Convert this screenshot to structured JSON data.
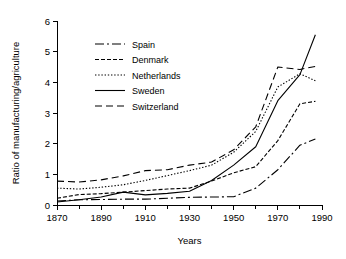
{
  "chart_data": {
    "type": "line",
    "title": "",
    "xlabel": "Years",
    "ylabel": "Ratio of manufacturing/agriculture",
    "xlim": [
      1870,
      1990
    ],
    "ylim": [
      0,
      6
    ],
    "xticks": [
      1870,
      1890,
      1910,
      1930,
      1950,
      1970,
      1990
    ],
    "xtick_labels": [
      "1870",
      "1890",
      "1910",
      "1930",
      "1950",
      "1970",
      "1990"
    ],
    "xminor_ticks": [
      1880,
      1900,
      1920,
      1940,
      1960,
      1980
    ],
    "yticks": [
      0,
      1,
      2,
      3,
      4,
      5,
      6
    ],
    "ytick_labels": [
      "0",
      "1",
      "2",
      "3",
      "4",
      "5",
      "6"
    ],
    "grid": false,
    "legend_position": "upper left",
    "series": [
      {
        "name": "Spain",
        "style": "dashdot",
        "dash": "9,3,2,3",
        "x": [
          1870,
          1880,
          1890,
          1900,
          1910,
          1920,
          1930,
          1940,
          1950,
          1960,
          1970,
          1980,
          1987
        ],
        "y": [
          0.13,
          0.17,
          0.18,
          0.19,
          0.19,
          0.22,
          0.25,
          0.26,
          0.27,
          0.55,
          1.15,
          1.95,
          2.15
        ]
      },
      {
        "name": "Denmark",
        "style": "dashed-short",
        "dash": "4,2",
        "x": [
          1870,
          1880,
          1890,
          1900,
          1910,
          1920,
          1930,
          1940,
          1950,
          1960,
          1970,
          1980,
          1987
        ],
        "y": [
          0.22,
          0.34,
          0.37,
          0.42,
          0.47,
          0.52,
          0.55,
          0.78,
          1.05,
          1.25,
          2.1,
          3.3,
          3.38
        ]
      },
      {
        "name": "Netherlands",
        "style": "dotted",
        "dash": "1.4,1.8",
        "x": [
          1870,
          1880,
          1890,
          1900,
          1910,
          1920,
          1930,
          1940,
          1950,
          1960,
          1970,
          1980,
          1987
        ],
        "y": [
          0.55,
          0.52,
          0.58,
          0.66,
          0.8,
          0.96,
          1.12,
          1.3,
          1.72,
          2.4,
          3.85,
          4.28,
          4.05
        ]
      },
      {
        "name": "Sweden",
        "style": "solid",
        "dash": "",
        "x": [
          1870,
          1880,
          1890,
          1900,
          1910,
          1920,
          1930,
          1940,
          1950,
          1960,
          1970,
          1980,
          1987
        ],
        "y": [
          0.1,
          0.17,
          0.26,
          0.42,
          0.33,
          0.38,
          0.45,
          0.8,
          1.3,
          1.9,
          3.4,
          4.25,
          5.55
        ]
      },
      {
        "name": "Switzerland",
        "style": "dashed-long",
        "dash": "7,4",
        "x": [
          1870,
          1880,
          1890,
          1900,
          1910,
          1920,
          1930,
          1940,
          1950,
          1960,
          1970,
          1980,
          1987
        ],
        "y": [
          0.78,
          0.75,
          0.82,
          0.95,
          1.12,
          1.15,
          1.3,
          1.4,
          1.8,
          2.55,
          4.5,
          4.42,
          4.52
        ]
      }
    ]
  },
  "legend": {
    "items": [
      {
        "label": "Spain"
      },
      {
        "label": "Denmark"
      },
      {
        "label": "Netherlands"
      },
      {
        "label": "Sweden"
      },
      {
        "label": "Switzerland"
      }
    ]
  }
}
